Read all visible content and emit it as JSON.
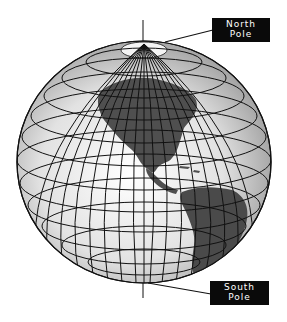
{
  "diagram": {
    "labels": {
      "north_pole": {
        "line1": "North",
        "line2": "Pole"
      },
      "south_pole": {
        "line1": "South",
        "line2": "Pole"
      }
    },
    "colors": {
      "background": "#ffffff",
      "ocean": "#e4e4e4",
      "land": "#555555",
      "grid": "#111111",
      "label_bg": "#0a0a0a",
      "label_text": "#ffffff"
    }
  }
}
